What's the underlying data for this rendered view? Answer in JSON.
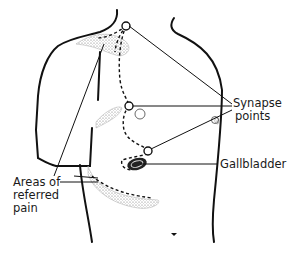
{
  "diagram": {
    "type": "anatomical illustration",
    "labels": {
      "synapse_line1": "Synapse",
      "synapse_line2": "points",
      "gallbladder": "Gallbladder",
      "areas_line1": "Areas of",
      "areas_line2": "referred",
      "areas_line3": "pain"
    },
    "colors": {
      "outline": "#111111",
      "stipple": "#9a9a9a",
      "background": "#ffffff"
    }
  }
}
